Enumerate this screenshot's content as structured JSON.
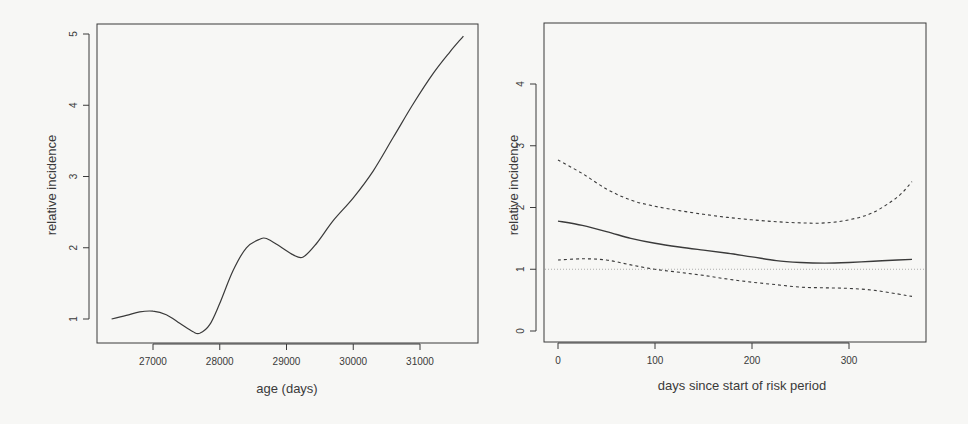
{
  "chart_data": [
    {
      "type": "line",
      "title": "",
      "xlabel": "age (days)",
      "ylabel": "relative incidence",
      "xlim": [
        26150,
        31900
      ],
      "ylim": [
        0.65,
        5.15
      ],
      "xticks": [
        27000,
        28000,
        29000,
        30000,
        31000
      ],
      "yticks": [
        1,
        2,
        3,
        4,
        5
      ],
      "grid": false,
      "legend": null,
      "series": [
        {
          "name": "age effect",
          "style": "solid",
          "x": [
            26380,
            26600,
            26800,
            27000,
            27200,
            27400,
            27600,
            27700,
            27850,
            28000,
            28200,
            28400,
            28600,
            28700,
            28900,
            29100,
            29250,
            29450,
            29700,
            30000,
            30300,
            30600,
            30900,
            31200,
            31450,
            31650
          ],
          "y": [
            1.0,
            1.05,
            1.1,
            1.11,
            1.06,
            0.94,
            0.82,
            0.8,
            0.92,
            1.22,
            1.68,
            2.0,
            2.12,
            2.13,
            2.02,
            1.9,
            1.87,
            2.06,
            2.38,
            2.7,
            3.08,
            3.55,
            4.02,
            4.45,
            4.75,
            4.97
          ]
        }
      ]
    },
    {
      "type": "line",
      "title": "",
      "xlabel": "days since start of risk period",
      "ylabel": "relative incidence",
      "xlim": [
        -12,
        378
      ],
      "ylim": [
        -0.18,
        5.0
      ],
      "xticks": [
        0,
        100,
        200,
        300
      ],
      "yticks": [
        0,
        1,
        2,
        3,
        4
      ],
      "grid": false,
      "legend": null,
      "reference_line": {
        "y": 1,
        "style": "dotted"
      },
      "series": [
        {
          "name": "estimate",
          "style": "solid",
          "x": [
            0,
            25,
            50,
            75,
            100,
            125,
            150,
            175,
            200,
            225,
            250,
            275,
            300,
            325,
            350,
            365
          ],
          "y": [
            1.78,
            1.71,
            1.61,
            1.5,
            1.42,
            1.36,
            1.31,
            1.26,
            1.2,
            1.14,
            1.11,
            1.1,
            1.11,
            1.13,
            1.15,
            1.16
          ]
        },
        {
          "name": "upper 95% CI",
          "style": "dashed",
          "x": [
            0,
            25,
            50,
            75,
            100,
            125,
            150,
            175,
            200,
            225,
            250,
            275,
            300,
            325,
            350,
            365
          ],
          "y": [
            2.77,
            2.55,
            2.3,
            2.12,
            2.02,
            1.95,
            1.89,
            1.84,
            1.8,
            1.77,
            1.75,
            1.75,
            1.8,
            1.92,
            2.17,
            2.42
          ]
        },
        {
          "name": "lower 95% CI",
          "style": "dashed",
          "x": [
            0,
            25,
            50,
            75,
            100,
            125,
            150,
            175,
            200,
            225,
            250,
            275,
            300,
            325,
            350,
            365
          ],
          "y": [
            1.15,
            1.17,
            1.15,
            1.07,
            1.0,
            0.95,
            0.9,
            0.84,
            0.79,
            0.75,
            0.71,
            0.7,
            0.69,
            0.66,
            0.6,
            0.56
          ]
        }
      ]
    }
  ],
  "panels": [
    {
      "ylabel": "relative incidence",
      "xlabel": "age (days)",
      "xtick_labels": [
        "27000",
        "28000",
        "29000",
        "30000",
        "31000"
      ],
      "ytick_labels": [
        "1",
        "2",
        "3",
        "4",
        "5"
      ]
    },
    {
      "ylabel": "relative incidence",
      "xlabel": "days since start of risk period",
      "xtick_labels": [
        "0",
        "100",
        "200",
        "300"
      ],
      "ytick_labels": [
        "0",
        "1",
        "2",
        "3",
        "4"
      ]
    }
  ],
  "colors": {
    "background": "#f7f7f5",
    "axis": "#3a3a3a",
    "line": "#3a3a3a",
    "reference": "#9a9a9a"
  }
}
